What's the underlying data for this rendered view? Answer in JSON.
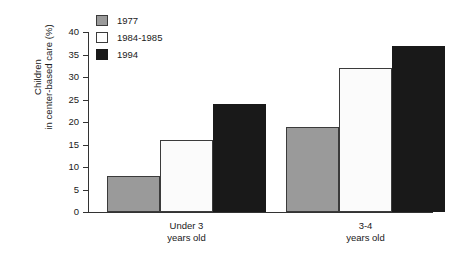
{
  "chart_data": {
    "type": "bar",
    "title": "",
    "xlabel": "",
    "ylabel_line1": "Children",
    "ylabel_line2": "in center-based care (%)",
    "ylim": [
      0,
      40
    ],
    "yticks": [
      0,
      5,
      10,
      15,
      20,
      25,
      30,
      35,
      40
    ],
    "grid": false,
    "legend_position": "top-left",
    "categories": [
      "Under 3 years old",
      "3-4 years old"
    ],
    "category_lines": [
      [
        "Under 3",
        "years old"
      ],
      [
        "3-4",
        "years old"
      ]
    ],
    "series": [
      {
        "name": "1977",
        "color": "#9a9a9a",
        "values": [
          8,
          19
        ]
      },
      {
        "name": "1984-1985",
        "color": "#fbfbfb",
        "values": [
          16,
          32
        ]
      },
      {
        "name": "1994",
        "color": "#191919",
        "values": [
          24,
          37
        ]
      }
    ]
  },
  "legend": {
    "items": [
      {
        "label": "1977"
      },
      {
        "label": "1984-1985"
      },
      {
        "label": "1994"
      }
    ]
  },
  "axis": {
    "tick_labels": [
      "40",
      "35",
      "30",
      "25",
      "20",
      "15",
      "10",
      "5",
      "0"
    ]
  }
}
